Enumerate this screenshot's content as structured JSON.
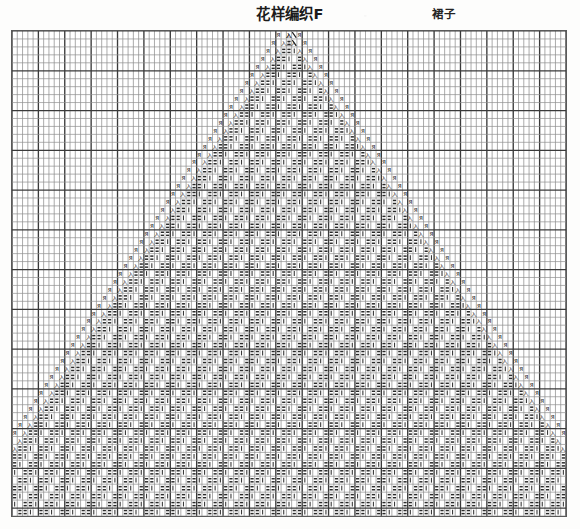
{
  "header": {
    "title": "花样编织F",
    "subtitle": "裙子"
  },
  "chart_data": {
    "type": "table",
    "title": "花样编织F",
    "subtitle": "裙子",
    "xlabel": "",
    "ylabel": "",
    "grid": {
      "columns": 105,
      "rows": 61,
      "cell_width_px": 5.29,
      "cell_height_px": 7.98,
      "major_gridline_every_columns": 5,
      "major_gridline_every_rows": 5,
      "origin_x_px": 11,
      "origin_y_px": 30,
      "width_px": 556,
      "height_px": 487,
      "grid_on": true
    },
    "legend_position": "none",
    "symbols": [
      {
        "key": "knit",
        "glyph": "|",
        "meaning": "knit stitch / plain square"
      },
      {
        "key": "purl",
        "glyph": "=",
        "meaning": "purl stitch (horizontal dash pair)"
      },
      {
        "key": "dec_left",
        "glyph": "入",
        "meaning": "left-leaning decrease"
      },
      {
        "key": "dec_right",
        "glyph": "Я",
        "meaning": "right-leaning decrease"
      },
      {
        "key": "dec_double",
        "glyph": "木",
        "meaning": "centred double decrease"
      },
      {
        "key": "yarn_over",
        "glyph": "△",
        "meaning": "yarn over / increase"
      }
    ],
    "motif": {
      "shape": "inverted-V (expanding downward)",
      "apex_row": 1,
      "apex_center_column": 53,
      "expansion_per_row_each_side": 1,
      "interior_fill": "paired purl dashes in a two-column rhythm",
      "left_border_symbols": [
        "dec_right",
        "dec_left"
      ],
      "right_border_symbols": [
        "dec_left",
        "dec_right"
      ],
      "apex_symbols": [
        "dec_right",
        "yarn_over",
        "dec_left",
        "dec_right"
      ]
    },
    "axis_ranges": {
      "x": [
        1,
        105
      ],
      "y": [
        1,
        61
      ]
    },
    "colors": {
      "background": "#fdfdfc",
      "grid_minor": "#8e8e8e",
      "grid_major": "#3a3a3a",
      "symbol": "#202020",
      "text": "#1b1b1b"
    }
  }
}
